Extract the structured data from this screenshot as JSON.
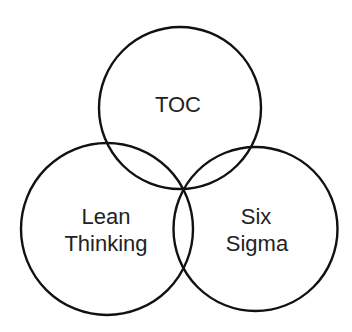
{
  "diagram": {
    "type": "venn",
    "background": "#ffffff",
    "stroke_color": "#111111",
    "text_color": "#222222",
    "sets": [
      {
        "id": "toc",
        "label_lines": [
          "TOC"
        ],
        "cx": 180,
        "cy": 108,
        "r": 81
      },
      {
        "id": "lean",
        "label_lines": [
          "Lean",
          "Thinking"
        ],
        "cx": 107,
        "cy": 229,
        "r": 86
      },
      {
        "id": "six-sigma",
        "label_lines": [
          "Six",
          "Sigma"
        ],
        "cx": 255.5,
        "cy": 229,
        "r": 82
      }
    ]
  }
}
